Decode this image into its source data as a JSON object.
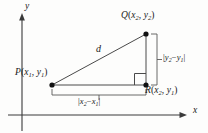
{
  "figure": {
    "axes": {
      "x_label": "x",
      "y_label": "y"
    },
    "points": [
      {
        "id": "P",
        "label_prefix": "P",
        "sub_x": "1",
        "sub_y": "1",
        "x": 52,
        "y": 85
      },
      {
        "id": "Q",
        "label_prefix": "Q",
        "sub_x": "2",
        "sub_y": "2",
        "x": 146,
        "y": 34
      },
      {
        "id": "R",
        "label_prefix": "R",
        "sub_x": "2",
        "sub_y": "1",
        "x": 146,
        "y": 85
      }
    ],
    "labels": {
      "point_q": "Q(x2, y2)",
      "point_p": "P(x1, y1)",
      "point_r": "R(x2, y1)",
      "hypotenuse": "d",
      "vertical_leg": "|y2 − y1|",
      "horizontal_leg": "|x2 − x1|"
    },
    "label_parts": {
      "q_name": "Q",
      "q_open": "(",
      "q_x": "x",
      "q_x_sub": "2",
      "q_comma": ", ",
      "q_y": "y",
      "q_y_sub": "2",
      "q_close": ")",
      "p_name": "P",
      "p_open": "(",
      "p_x": "x",
      "p_x_sub": "1",
      "p_comma": ", ",
      "p_y": "y",
      "p_y_sub": "1",
      "p_close": ")",
      "r_name": "R",
      "r_open": "(",
      "r_x": "x",
      "r_x_sub": "2",
      "r_comma": ", ",
      "r_y": "y",
      "r_y_sub": "1",
      "r_close": ")",
      "d": "d",
      "dy_bar_open": "|",
      "dy_y_a": "y",
      "dy_y_a_sub": "2",
      "dy_minus": "−",
      "dy_y_b": "y",
      "dy_y_b_sub": "1",
      "dy_bar_close": "|",
      "dx_bar_open": "|",
      "dx_x_a": "x",
      "dx_x_a_sub": "2",
      "dx_minus": "−",
      "dx_x_b": "x",
      "dx_x_b_sub": "1",
      "dx_bar_close": "|"
    },
    "colors": {
      "background": "#fdfdfc",
      "axis": "#3a3a3a",
      "triangle": "#4a4a4a",
      "bracket": "#5a5a5a",
      "point": "#111111",
      "text": "#1a1a1a"
    }
  }
}
